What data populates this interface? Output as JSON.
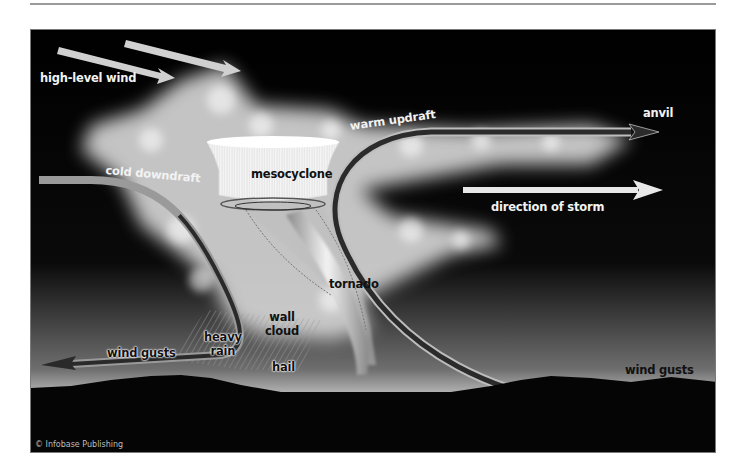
{
  "diagram": {
    "labels": {
      "high_level_wind": "high-level wind",
      "anvil": "anvil",
      "warm_updraft": "warm updraft",
      "mesocyclone": "mesocyclone",
      "cold_downdraft": "cold downdraft",
      "direction_of_storm": "direction of storm",
      "tornado": "tornado",
      "wall_cloud_line1": "wall",
      "wall_cloud_line2": "cloud",
      "heavy_rain_line1": "heavy",
      "heavy_rain_line2": "rain",
      "hail": "hail",
      "wind_gusts_left": "wind gusts",
      "wind_gusts_right": "wind gusts"
    },
    "credit": "© Infobase Publishing",
    "colors": {
      "background": "#000000",
      "cloud": "#d9d9d9",
      "arrow_light": "#d8d8d8",
      "arrow_dark": "#2a2a2a",
      "horizon_glow": "#f5f5f5",
      "ground": "#050505"
    }
  }
}
